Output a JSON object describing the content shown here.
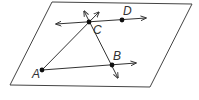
{
  "diagram": {
    "type": "geometry-plane",
    "labels": {
      "A": "A",
      "B": "B",
      "C": "C",
      "D": "D"
    },
    "points": {
      "A": [
        42,
        70
      ],
      "B": [
        112,
        65
      ],
      "C": [
        89,
        22
      ],
      "D": [
        122,
        19
      ]
    },
    "colors": {
      "stroke": "#333333",
      "plane": "#444444",
      "background": "#ffffff"
    }
  }
}
